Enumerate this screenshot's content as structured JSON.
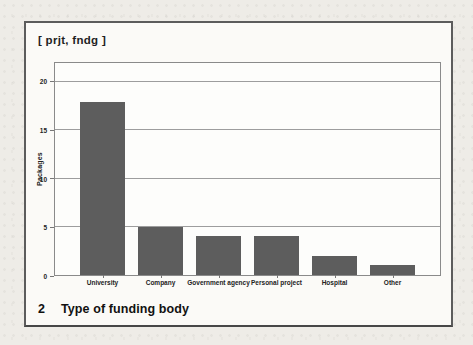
{
  "figure": {
    "tag_label": "[ prjt, fndg ]",
    "caption_number": "2",
    "caption_text": "Type of funding body"
  },
  "chart_data": {
    "type": "bar",
    "title": "",
    "categories": [
      "University",
      "Company",
      "Government agency",
      "Personal project",
      "Hospital",
      "Other"
    ],
    "values": [
      18,
      5,
      4,
      4,
      2,
      1
    ],
    "xlabel": "",
    "ylabel": "Packages",
    "ylim": [
      0,
      22
    ],
    "yticks": [
      0,
      5,
      10,
      15,
      20
    ],
    "grid": true,
    "legend": "none",
    "bar_color": "#5d5d5d"
  },
  "colors": {
    "page_background": "#eeece7",
    "frame_background": "#fbfaf7",
    "frame_border": "#5c5c5c",
    "bar": "#5d5d5d",
    "gridline": "#9d9d9d",
    "axis_border": "#8a8a8a",
    "text": "#1f1f1f"
  }
}
